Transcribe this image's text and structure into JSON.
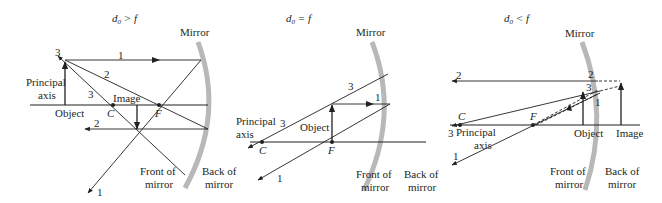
{
  "colors": {
    "ink": "#231f20",
    "mirror": "#b8b8b8",
    "background": "#ffffff"
  },
  "panels": [
    {
      "title_main": "d",
      "title_sub": "0",
      "title_rel": " > f",
      "mirror_label": "Mirror",
      "axis_label_line1": "Principal",
      "axis_label_line2": "axis",
      "object_label": "Object",
      "image_label": "Image",
      "C_label": "C",
      "F_label": "F",
      "front_line1": "Front of",
      "front_line2": "mirror",
      "back_line1": "Back of",
      "back_line2": "mirror",
      "ray_labels": [
        "1",
        "2",
        "3",
        "3",
        "2",
        "1"
      ]
    },
    {
      "title_main": "d",
      "title_sub": "0",
      "title_rel": " = f",
      "mirror_label": "Mirror",
      "axis_label_line1": "Principal",
      "axis_label_line2": "axis",
      "object_label": "Object",
      "C_label": "C",
      "F_label": "F",
      "front_line1": "Front of",
      "front_line2": "mirror",
      "back_line1": "Back of",
      "back_line2": "mirror",
      "ray_labels": [
        "3",
        "1",
        "3",
        "1"
      ]
    },
    {
      "title_main": "d",
      "title_sub": "0",
      "title_rel": " < f",
      "mirror_label": "Mirror",
      "axis_label_line1": "Principal",
      "axis_label_line2": "axis",
      "object_label": "Object",
      "image_label": "Image",
      "C_label": "C",
      "F_label": "F",
      "front_line1": "Front of",
      "front_line2": "mirror",
      "back_line1": "Back of",
      "back_line2": "mirror",
      "ray_labels": [
        "2",
        "2",
        "3",
        "1",
        "3",
        "1"
      ]
    }
  ]
}
